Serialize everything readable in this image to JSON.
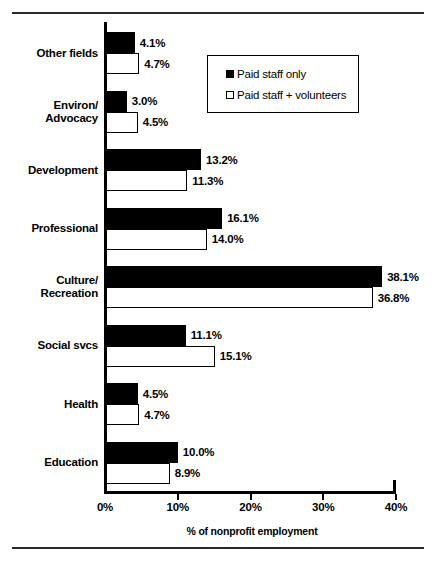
{
  "chart_data": {
    "type": "bar",
    "orientation": "horizontal",
    "title": "",
    "xlabel": "% of nonprofit employment",
    "ylabel": "",
    "xlim": [
      0,
      40
    ],
    "xticks": [
      "0%",
      "10%",
      "20%",
      "30%",
      "40%"
    ],
    "xtick_values": [
      0,
      10,
      20,
      30,
      40
    ],
    "grid": false,
    "legend_position": "top-right-inside",
    "categories": [
      "Other fields",
      "Environ/ Advocacy",
      "Development",
      "Professional",
      "Culture/ Recreation",
      "Social svcs",
      "Health",
      "Education"
    ],
    "category_lines": [
      [
        "Other fields"
      ],
      [
        "Environ/",
        "Advocacy"
      ],
      [
        "Development"
      ],
      [
        "Professional"
      ],
      [
        "Culture/",
        "Recreation"
      ],
      [
        "Social svcs"
      ],
      [
        "Health"
      ],
      [
        "Education"
      ]
    ],
    "series": [
      {
        "name": "Paid staff only",
        "style": "filled",
        "values": [
          4.1,
          3.0,
          13.2,
          16.1,
          38.1,
          11.1,
          4.5,
          10.0
        ],
        "labels": [
          "4.1%",
          "3.0%",
          "13.2%",
          "16.1%",
          "38.1%",
          "11.1%",
          "4.5%",
          "10.0%"
        ]
      },
      {
        "name": "Paid staff + volunteers",
        "style": "hollow",
        "values": [
          4.7,
          4.5,
          11.3,
          14.0,
          36.8,
          15.1,
          4.7,
          8.9
        ],
        "labels": [
          "4.7%",
          "4.5%",
          "11.3%",
          "14.0%",
          "36.8%",
          "15.1%",
          "4.7%",
          "8.9%"
        ]
      }
    ]
  },
  "legend": {
    "items": [
      {
        "label": "Paid staff only",
        "style": "filled"
      },
      {
        "label": "Paid staff + volunteers",
        "style": "hollow"
      }
    ]
  },
  "colors": {
    "paid_staff_only": "#000000",
    "paid_staff_plus_volunteers": "#ffffff",
    "axis": "#000000",
    "background": "#ffffff"
  }
}
